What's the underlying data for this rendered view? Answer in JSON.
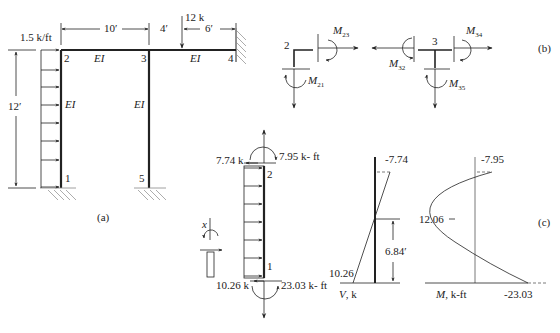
{
  "figure_a": {
    "caption": "(a)",
    "load_label": "1.5 k/ft",
    "point_load": "12 k",
    "dims": {
      "span_23": "10′",
      "a": "4′",
      "b": "6′",
      "height": "12′"
    },
    "nodes": [
      "1",
      "2",
      "3",
      "4",
      "5"
    ],
    "stiffness": "EI"
  },
  "figure_b": {
    "caption": "(b)",
    "node_left": "2",
    "node_right": "3",
    "moments": {
      "m23": {
        "main": "M",
        "sub": "23"
      },
      "m21": {
        "main": "M",
        "sub": "21"
      },
      "m32": {
        "main": "M",
        "sub": "32"
      },
      "m34": {
        "main": "M",
        "sub": "34"
      },
      "m35": {
        "main": "M",
        "sub": "35"
      }
    }
  },
  "figure_c": {
    "caption": "(c)",
    "fbd": {
      "top_shear": "7.74 k",
      "top_moment": "7.95 k- ft",
      "bottom_shear": "10.26 k",
      "bottom_moment": "23.03 k- ft",
      "node_top": "2",
      "node_bottom": "1",
      "x_label": "x"
    },
    "shear_diagram": {
      "top_value": "-7.74",
      "bottom_value": "10.26",
      "zero_location": "6.84′",
      "axis_label_main": "V",
      "axis_label_unit": ", k"
    },
    "moment_diagram": {
      "top_value": "-7.95",
      "peak_value": "12.06",
      "bottom_value": "-23.03",
      "axis_label_main": "M",
      "axis_label_unit": ", k-ft"
    }
  }
}
